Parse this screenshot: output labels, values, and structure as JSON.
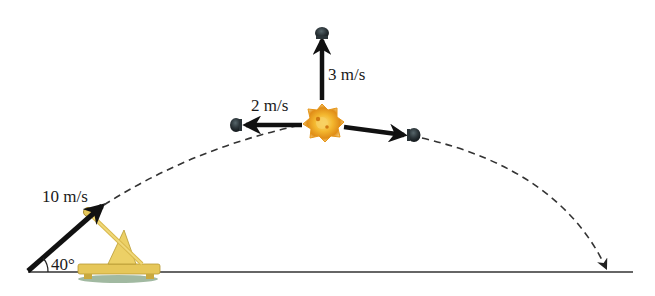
{
  "diagram": {
    "type": "projectile-explosion",
    "launch": {
      "speed_label": "10 m/s",
      "angle_label": "40°"
    },
    "fragments": [
      {
        "direction": "up",
        "speed_label": "3 m/s"
      },
      {
        "direction": "left",
        "speed_label": "2 m/s"
      },
      {
        "direction": "right-down",
        "speed_label": ""
      }
    ],
    "colors": {
      "arrow": "#111111",
      "dashed_path": "#333333",
      "ground": "#333333",
      "fragment": "#2b3438",
      "explosion_outer": "#e8a21c",
      "explosion_inner": "#f6c744",
      "catapult": "#e6c75a",
      "catapult_shadow": "#7a9a7a"
    }
  }
}
